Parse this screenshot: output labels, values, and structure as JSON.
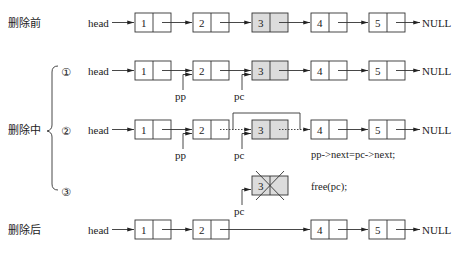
{
  "rows": [
    {
      "id": "before",
      "label": "删除前",
      "head": "head",
      "nodes": [
        "1",
        "2",
        "3",
        "4",
        "5"
      ],
      "highlight": [
        "3"
      ],
      "tail": "NULL"
    },
    {
      "id": "step1",
      "step": "①",
      "head": "head",
      "nodes": [
        "1",
        "2",
        "3",
        "4",
        "5"
      ],
      "highlight": [
        "3"
      ],
      "tail": "NULL",
      "pointers": [
        {
          "name": "pp",
          "target": "2"
        },
        {
          "name": "pc",
          "target": "3"
        }
      ]
    },
    {
      "id": "step2",
      "step": "②",
      "head": "head",
      "nodes": [
        "1",
        "2",
        "3",
        "4",
        "5"
      ],
      "highlight": [
        "3"
      ],
      "tail": "NULL",
      "pointers": [
        {
          "name": "pp",
          "target": "2"
        },
        {
          "name": "pc",
          "target": "3"
        }
      ],
      "code": "pp->next=pc->next;"
    },
    {
      "id": "step3",
      "step": "③",
      "nodes": [
        "3"
      ],
      "freed": true,
      "pointers": [
        {
          "name": "pc",
          "target": "3"
        }
      ],
      "code": "free(pc);"
    },
    {
      "id": "after",
      "label": "删除后",
      "head": "head",
      "nodes": [
        "1",
        "2",
        "4",
        "5"
      ],
      "tail": "NULL"
    }
  ],
  "group_label": "删除中",
  "colors": {
    "stroke": "#333333",
    "highlight_fill": "#dcdcdc",
    "background": "#ffffff"
  }
}
